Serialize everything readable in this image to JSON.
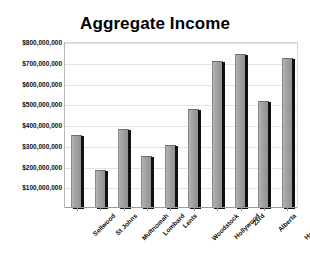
{
  "chart_data": {
    "type": "bar",
    "title": "Aggregate Income",
    "xlabel": "",
    "ylabel": "",
    "categories": [
      "Sellwood",
      "St Johns",
      "Multnomah",
      "Lombard",
      "Lents",
      "Woodstock",
      "Hollywood",
      "23rd",
      "Alberta",
      "Hawthorne"
    ],
    "values": [
      345000000,
      178000000,
      378000000,
      248000000,
      300000000,
      470000000,
      705000000,
      738000000,
      510000000,
      718000000
    ],
    "ylim": [
      0,
      800000000
    ],
    "ytick_values": [
      100000000,
      200000000,
      300000000,
      400000000,
      500000000,
      600000000,
      700000000,
      800000000
    ],
    "ytick_labels": [
      "$100,000,000",
      "$200,000,000",
      "$300,000,000",
      "$400,000,000",
      "$500,000,000",
      "$600,000,000",
      "$700,000,000",
      "$800,000,000"
    ],
    "grid": true,
    "legend": false,
    "legend_position": "none",
    "bar_color": "#9a9a9a",
    "bar_shadow_color": "#101010",
    "plot_background": "#ffffff",
    "text_color": "#0d0d0d"
  }
}
